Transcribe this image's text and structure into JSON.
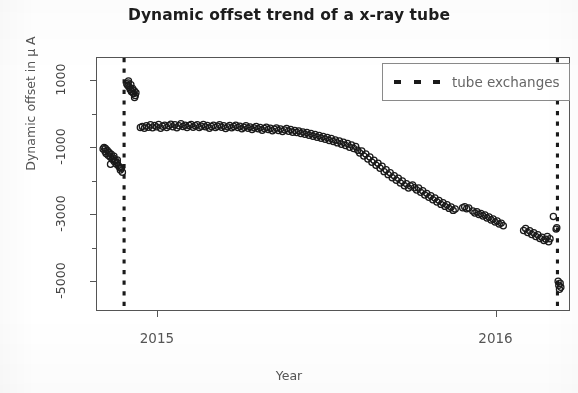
{
  "chart_data": {
    "type": "scatter",
    "title": "Dynamic offset trend of a x-ray tube",
    "xlabel": "Year",
    "ylabel": "Dynamic offset in μ A",
    "grid": false,
    "legend_position": "top-right",
    "xlim": [
      2014.82,
      2016.22
    ],
    "ylim": [
      -5900,
      1700
    ],
    "xticks": [
      {
        "value": 2015,
        "label": "2015"
      },
      {
        "value": 2016,
        "label": "2016"
      }
    ],
    "yticks": [
      {
        "value": 1000,
        "label": "1000"
      },
      {
        "value": -1000,
        "label": "-1000"
      },
      {
        "value": -3000,
        "label": "-3000"
      },
      {
        "value": -5000,
        "label": "-5000"
      }
    ],
    "yticks_minor": [
      0,
      -2000,
      -4000
    ],
    "series": [
      {
        "name": "dynamic offset",
        "marker": "open-circle",
        "color": "#1a1a1a",
        "points": [
          [
            2014.838,
            -1020
          ],
          [
            2014.841,
            -980
          ],
          [
            2014.844,
            -1100
          ],
          [
            2014.847,
            -1160
          ],
          [
            2014.85,
            -1060
          ],
          [
            2014.853,
            -1210
          ],
          [
            2014.856,
            -1140
          ],
          [
            2014.859,
            -1260
          ],
          [
            2014.862,
            -1180
          ],
          [
            2014.865,
            -1330
          ],
          [
            2014.868,
            -1290
          ],
          [
            2014.871,
            -1400
          ],
          [
            2014.874,
            -1360
          ],
          [
            2014.877,
            -1470
          ],
          [
            2014.88,
            -1430
          ],
          [
            2014.883,
            -1520
          ],
          [
            2014.886,
            -1560
          ],
          [
            2014.889,
            -1650
          ],
          [
            2014.892,
            -1600
          ],
          [
            2014.895,
            -1720
          ],
          [
            2014.86,
            -1480
          ],
          [
            2014.87,
            -1240
          ],
          [
            2014.88,
            -1350
          ],
          [
            2014.89,
            -1580
          ],
          [
            2014.845,
            -1010
          ],
          [
            2014.855,
            -1120
          ],
          [
            2014.908,
            920
          ],
          [
            2014.911,
            880
          ],
          [
            2014.913,
            1010
          ],
          [
            2014.915,
            830
          ],
          [
            2014.918,
            760
          ],
          [
            2014.92,
            900
          ],
          [
            2014.922,
            690
          ],
          [
            2014.925,
            790
          ],
          [
            2014.928,
            640
          ],
          [
            2014.93,
            720
          ],
          [
            2014.933,
            580
          ],
          [
            2014.935,
            660
          ],
          [
            2014.912,
            950
          ],
          [
            2014.924,
            700
          ],
          [
            2014.931,
            520
          ],
          [
            2014.948,
            -380
          ],
          [
            2014.954,
            -350
          ],
          [
            2014.96,
            -400
          ],
          [
            2014.966,
            -330
          ],
          [
            2014.972,
            -370
          ],
          [
            2014.978,
            -300
          ],
          [
            2014.984,
            -390
          ],
          [
            2014.99,
            -320
          ],
          [
            2014.996,
            -360
          ],
          [
            2015.002,
            -290
          ],
          [
            2015.008,
            -400
          ],
          [
            2015.014,
            -340
          ],
          [
            2015.02,
            -310
          ],
          [
            2015.026,
            -380
          ],
          [
            2015.032,
            -330
          ],
          [
            2015.038,
            -280
          ],
          [
            2015.044,
            -360
          ],
          [
            2015.05,
            -300
          ],
          [
            2015.056,
            -390
          ],
          [
            2015.062,
            -330
          ],
          [
            2015.068,
            -270
          ],
          [
            2015.074,
            -350
          ],
          [
            2015.08,
            -310
          ],
          [
            2015.086,
            -380
          ],
          [
            2015.092,
            -320
          ],
          [
            2015.098,
            -290
          ],
          [
            2015.104,
            -370
          ],
          [
            2015.11,
            -330
          ],
          [
            2015.116,
            -300
          ],
          [
            2015.122,
            -380
          ],
          [
            2015.128,
            -340
          ],
          [
            2015.134,
            -290
          ],
          [
            2015.14,
            -360
          ],
          [
            2015.146,
            -320
          ],
          [
            2015.152,
            -400
          ],
          [
            2015.158,
            -350
          ],
          [
            2015.164,
            -310
          ],
          [
            2015.17,
            -380
          ],
          [
            2015.176,
            -340
          ],
          [
            2015.182,
            -300
          ],
          [
            2015.188,
            -370
          ],
          [
            2015.194,
            -330
          ],
          [
            2015.2,
            -410
          ],
          [
            2015.206,
            -360
          ],
          [
            2015.212,
            -320
          ],
          [
            2015.218,
            -390
          ],
          [
            2015.224,
            -350
          ],
          [
            2015.23,
            -310
          ],
          [
            2015.236,
            -380
          ],
          [
            2015.242,
            -340
          ],
          [
            2015.248,
            -420
          ],
          [
            2015.254,
            -370
          ],
          [
            2015.26,
            -330
          ],
          [
            2015.266,
            -400
          ],
          [
            2015.272,
            -360
          ],
          [
            2015.278,
            -440
          ],
          [
            2015.284,
            -390
          ],
          [
            2015.29,
            -350
          ],
          [
            2015.296,
            -420
          ],
          [
            2015.302,
            -380
          ],
          [
            2015.308,
            -460
          ],
          [
            2015.314,
            -410
          ],
          [
            2015.32,
            -370
          ],
          [
            2015.326,
            -440
          ],
          [
            2015.332,
            -400
          ],
          [
            2015.338,
            -480
          ],
          [
            2015.344,
            -430
          ],
          [
            2015.35,
            -390
          ],
          [
            2015.356,
            -470
          ],
          [
            2015.362,
            -420
          ],
          [
            2015.368,
            -500
          ],
          [
            2015.374,
            -450
          ],
          [
            2015.38,
            -410
          ],
          [
            2015.386,
            -490
          ],
          [
            2015.392,
            -440
          ],
          [
            2015.398,
            -520
          ],
          [
            2015.404,
            -470
          ],
          [
            2015.41,
            -530
          ],
          [
            2015.416,
            -480
          ],
          [
            2015.422,
            -560
          ],
          [
            2015.428,
            -510
          ],
          [
            2015.434,
            -580
          ],
          [
            2015.44,
            -530
          ],
          [
            2015.446,
            -610
          ],
          [
            2015.452,
            -560
          ],
          [
            2015.458,
            -640
          ],
          [
            2015.464,
            -590
          ],
          [
            2015.47,
            -670
          ],
          [
            2015.476,
            -620
          ],
          [
            2015.482,
            -700
          ],
          [
            2015.488,
            -650
          ],
          [
            2015.494,
            -730
          ],
          [
            2015.5,
            -680
          ],
          [
            2015.506,
            -770
          ],
          [
            2015.512,
            -710
          ],
          [
            2015.518,
            -800
          ],
          [
            2015.524,
            -750
          ],
          [
            2015.53,
            -840
          ],
          [
            2015.536,
            -780
          ],
          [
            2015.542,
            -880
          ],
          [
            2015.548,
            -820
          ],
          [
            2015.554,
            -920
          ],
          [
            2015.56,
            -860
          ],
          [
            2015.566,
            -970
          ],
          [
            2015.572,
            -900
          ],
          [
            2015.578,
            -1010
          ],
          [
            2015.584,
            -950
          ],
          [
            2015.59,
            -1060
          ],
          [
            2015.596,
            -1140
          ],
          [
            2015.602,
            -1080
          ],
          [
            2015.608,
            -1230
          ],
          [
            2015.614,
            -1170
          ],
          [
            2015.62,
            -1320
          ],
          [
            2015.626,
            -1260
          ],
          [
            2015.632,
            -1420
          ],
          [
            2015.638,
            -1360
          ],
          [
            2015.644,
            -1510
          ],
          [
            2015.65,
            -1450
          ],
          [
            2015.656,
            -1600
          ],
          [
            2015.662,
            -1540
          ],
          [
            2015.668,
            -1700
          ],
          [
            2015.674,
            -1640
          ],
          [
            2015.68,
            -1790
          ],
          [
            2015.686,
            -1730
          ],
          [
            2015.692,
            -1880
          ],
          [
            2015.698,
            -1820
          ],
          [
            2015.704,
            -1960
          ],
          [
            2015.71,
            -1900
          ],
          [
            2015.716,
            -2040
          ],
          [
            2015.722,
            -1980
          ],
          [
            2015.728,
            -2120
          ],
          [
            2015.734,
            -2060
          ],
          [
            2015.74,
            -2190
          ],
          [
            2015.746,
            -2130
          ],
          [
            2015.752,
            -2100
          ],
          [
            2015.758,
            -2180
          ],
          [
            2015.764,
            -2250
          ],
          [
            2015.77,
            -2190
          ],
          [
            2015.776,
            -2320
          ],
          [
            2015.782,
            -2270
          ],
          [
            2015.788,
            -2400
          ],
          [
            2015.794,
            -2350
          ],
          [
            2015.8,
            -2470
          ],
          [
            2015.806,
            -2420
          ],
          [
            2015.812,
            -2540
          ],
          [
            2015.818,
            -2490
          ],
          [
            2015.824,
            -2610
          ],
          [
            2015.83,
            -2560
          ],
          [
            2015.836,
            -2680
          ],
          [
            2015.842,
            -2630
          ],
          [
            2015.848,
            -2740
          ],
          [
            2015.854,
            -2690
          ],
          [
            2015.86,
            -2800
          ],
          [
            2015.866,
            -2760
          ],
          [
            2015.872,
            -2860
          ],
          [
            2015.878,
            -2820
          ],
          [
            2015.9,
            -2780
          ],
          [
            2015.906,
            -2750
          ],
          [
            2015.912,
            -2810
          ],
          [
            2015.918,
            -2790
          ],
          [
            2015.93,
            -2880
          ],
          [
            2015.936,
            -2940
          ],
          [
            2015.942,
            -2900
          ],
          [
            2015.948,
            -2980
          ],
          [
            2015.954,
            -2950
          ],
          [
            2015.96,
            -3030
          ],
          [
            2015.966,
            -3000
          ],
          [
            2015.972,
            -3090
          ],
          [
            2015.978,
            -3060
          ],
          [
            2015.984,
            -3150
          ],
          [
            2015.99,
            -3120
          ],
          [
            2015.996,
            -3210
          ],
          [
            2016.002,
            -3180
          ],
          [
            2016.008,
            -3270
          ],
          [
            2016.014,
            -3240
          ],
          [
            2016.02,
            -3320
          ],
          [
            2016.08,
            -3460
          ],
          [
            2016.086,
            -3400
          ],
          [
            2016.092,
            -3520
          ],
          [
            2016.098,
            -3470
          ],
          [
            2016.104,
            -3580
          ],
          [
            2016.11,
            -3530
          ],
          [
            2016.116,
            -3640
          ],
          [
            2016.122,
            -3590
          ],
          [
            2016.128,
            -3700
          ],
          [
            2016.134,
            -3660
          ],
          [
            2016.14,
            -3760
          ],
          [
            2016.146,
            -3720
          ],
          [
            2016.15,
            -3640
          ],
          [
            2016.154,
            -3800
          ],
          [
            2016.158,
            -3710
          ],
          [
            2016.168,
            -3040
          ],
          [
            2016.176,
            -3420
          ],
          [
            2016.178,
            -3380
          ],
          [
            2016.182,
            -4980
          ],
          [
            2016.184,
            -5100
          ],
          [
            2016.186,
            -5220
          ],
          [
            2016.188,
            -5040
          ],
          [
            2016.19,
            -5160
          ]
        ]
      }
    ],
    "vlines": [
      {
        "x": 2014.9,
        "style": "dotted",
        "label": "tube exchanges",
        "color": "#1a1a1a"
      },
      {
        "x": 2016.18,
        "style": "dotted",
        "label": "tube exchanges",
        "color": "#1a1a1a"
      }
    ],
    "legend": [
      {
        "label": "tube exchanges",
        "marker": "dotted-line",
        "color": "#1a1a1a"
      }
    ]
  },
  "legend": {
    "entry_label": "tube exchanges"
  }
}
